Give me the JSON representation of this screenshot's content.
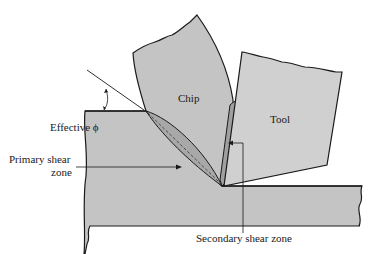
{
  "diagram": {
    "labels": {
      "chip": "Chip",
      "tool": "Tool",
      "effective_phi": "Effective ϕ",
      "primary_shear_zone_line1": "Primary shear",
      "primary_shear_zone_line2": "zone",
      "secondary_shear_zone": "Secondary shear zone"
    },
    "colors": {
      "material_fill": "#c4c4c4",
      "shear_zone_fill": "#a8a8a8",
      "outline": "#1a1a1a",
      "background": "#ffffff"
    }
  }
}
